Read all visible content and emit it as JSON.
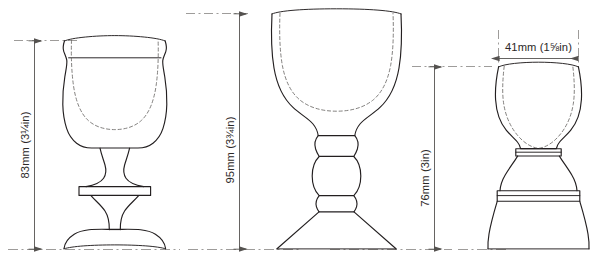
{
  "drawing": {
    "title": "Goblet profile drawings with dimensions",
    "background_color": "#ffffff",
    "line_color": "#231f20",
    "hidden_line_color": "#6d6a68",
    "dimension_color": "#555250",
    "figures": [
      {
        "id": "goblet-left",
        "name": "bucket-bowl-goblet",
        "description": "Flared bucket bowl goblet with merese collar and domed foot",
        "dimension": {
          "label": "83mm (3¼in)",
          "value_mm": 83,
          "value_in": "3¼in",
          "orientation": "vertical",
          "measures": "overall height"
        }
      },
      {
        "id": "goblet-middle",
        "name": "u-bowl-knopped-goblet",
        "description": "U-shaped bowl goblet with triple knopped stem and conical foot",
        "dimension": {
          "label": "95mm (3¾in)",
          "value_mm": 95,
          "value_in": "3¾in",
          "orientation": "vertical",
          "measures": "overall height"
        }
      },
      {
        "id": "goblet-right",
        "name": "egg-cup-goblet",
        "description": "Egg-cup bowl goblet with short waisted stem and flared pedestal foot",
        "dimensions": [
          {
            "label": "41mm (1⅝in)",
            "value_mm": 41,
            "value_in": "1⅝in",
            "orientation": "horizontal",
            "measures": "rim diameter"
          },
          {
            "label": "76mm (3in)",
            "value_mm": 76,
            "value_in": "3in",
            "orientation": "vertical",
            "measures": "overall height"
          }
        ]
      }
    ],
    "labels": {
      "left_height": "83mm (3¼in)",
      "middle_height": "95mm (3¾in)",
      "right_width": "41mm (1⅝in)",
      "right_height": "76mm (3in)"
    }
  }
}
